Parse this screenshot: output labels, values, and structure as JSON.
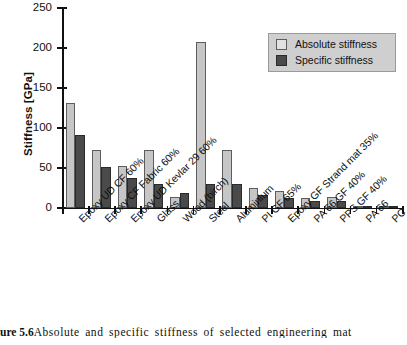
{
  "chart_data": {
    "type": "bar",
    "title": "",
    "xlabel": "",
    "ylabel": "Stiffness [GPa]",
    "ylim": [
      0,
      250
    ],
    "yticks": [
      0,
      50,
      100,
      150,
      200,
      250
    ],
    "grid": false,
    "legend_position": "top-right",
    "categories": [
      "Epoxy UD CF 60%",
      "Epoxy CF Fabric 60%",
      "Epoxy UD Kevlar 29 60%",
      "Glass",
      "Wood (birch)",
      "Steel",
      "Aluminium",
      "PI GF 65%",
      "Epoxy GF Strand mat 35%",
      "PA 66 GF 40%",
      "PPS GF 40%",
      "PA 66",
      "PC"
    ],
    "series": [
      {
        "name": "Absolute stiffness",
        "color": "#c6c6c6",
        "values": [
          131,
          73,
          53,
          72,
          14,
          208,
          73,
          25,
          21,
          13,
          14,
          3,
          2
        ]
      },
      {
        "name": "Specific stiffness",
        "color": "#4a4a4a",
        "values": [
          91,
          51,
          38,
          30,
          19,
          30,
          30,
          16,
          13,
          9,
          9,
          3,
          2
        ]
      }
    ]
  },
  "legend": {
    "items": [
      {
        "label": "Absolute stiffness"
      },
      {
        "label": "Specific stiffness"
      }
    ]
  },
  "caption": {
    "number": "ure 5.6",
    "text": "Absolute and specific stiffness of selected engineering mat"
  }
}
